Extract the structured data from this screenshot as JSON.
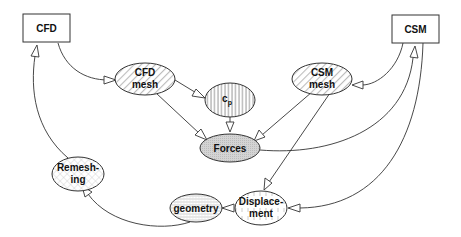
{
  "diagram": {
    "nodes": [
      {
        "id": "cfd",
        "label": "CFD",
        "shape": "box",
        "fill": "none"
      },
      {
        "id": "csm",
        "label": "CSM",
        "shape": "box",
        "fill": "none"
      },
      {
        "id": "cfd_mesh",
        "label_line1": "CFD",
        "label_line2": "mesh",
        "shape": "ellipse",
        "fill": "diagonal-hatch"
      },
      {
        "id": "cp",
        "label": "c",
        "label_sub": "p",
        "shape": "ellipse",
        "fill": "vertical-stripes"
      },
      {
        "id": "csm_mesh",
        "label_line1": "CSM",
        "label_line2": "mesh",
        "shape": "ellipse",
        "fill": "diagonal-hatch"
      },
      {
        "id": "forces",
        "label": "Forces",
        "shape": "ellipse",
        "fill": "dotted-gray"
      },
      {
        "id": "remeshing",
        "label_line1": "Remesh-",
        "label_line2": "ing",
        "shape": "ellipse",
        "fill": "cross-hatch"
      },
      {
        "id": "geometry",
        "label": "geometry",
        "shape": "ellipse",
        "fill": "horizontal-grid"
      },
      {
        "id": "displacement",
        "label_line1": "Displace-",
        "label_line2": "ment",
        "shape": "ellipse",
        "fill": "vertical-dashes"
      }
    ],
    "edges": [
      {
        "from": "CFD",
        "to": "CFD mesh"
      },
      {
        "from": "CFD mesh",
        "to": "c_p"
      },
      {
        "from": "CFD mesh",
        "to": "Forces"
      },
      {
        "from": "c_p",
        "to": "Forces"
      },
      {
        "from": "CSM mesh",
        "to": "Forces"
      },
      {
        "from": "CSM",
        "to": "CSM mesh"
      },
      {
        "from": "Forces",
        "to": "CSM"
      },
      {
        "from": "CSM mesh",
        "to": "Displacement"
      },
      {
        "from": "CSM",
        "to": "Displacement"
      },
      {
        "from": "Displacement",
        "to": "geometry"
      },
      {
        "from": "geometry",
        "to": "Remeshing"
      },
      {
        "from": "Remeshing",
        "to": "CFD"
      }
    ],
    "colors": {
      "stroke": "#333333",
      "forces_fill": "#d0d0d0",
      "background": "#ffffff"
    }
  }
}
